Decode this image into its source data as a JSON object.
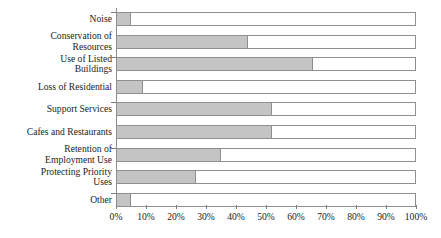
{
  "chart_data": {
    "type": "bar",
    "orientation": "horizontal",
    "stacked": true,
    "title": "",
    "subtitle": "",
    "xlabel": "",
    "ylabel": "",
    "xlim": [
      0,
      100
    ],
    "grid": false,
    "legend": null,
    "axis": {
      "tick_labels": [
        "0%",
        "10%",
        "20%",
        "30%",
        "40%",
        "50%",
        "60%",
        "70%",
        "80%",
        "90%",
        "100%"
      ],
      "tick_values": [
        0,
        10,
        20,
        30,
        40,
        50,
        60,
        70,
        80,
        90,
        100
      ],
      "tick_suffix": "%"
    },
    "colors": {
      "filled": "#c4c4c4",
      "remainder": "#ffffff",
      "outline": "#8f8f8f",
      "axis": "#8a8a8a"
    },
    "categories": [
      "Noise",
      "Conservation of\nResources",
      "Use of Listed\nBuildings",
      "Loss of Residential",
      "Support Services",
      "Cafes and Restaurants",
      "Retention of\nEmployment Use",
      "Protecting Priority\nUses",
      "Other"
    ],
    "values": [
      5,
      44,
      65.5,
      9,
      52,
      52,
      35,
      26.5,
      5
    ],
    "series": [
      {
        "name": "Filled",
        "values": [
          5,
          44,
          65.5,
          9,
          52,
          52,
          35,
          26.5,
          5
        ]
      },
      {
        "name": "Remainder",
        "values": [
          95,
          56,
          34.5,
          91,
          48,
          48,
          65,
          73.5,
          95
        ]
      }
    ]
  }
}
